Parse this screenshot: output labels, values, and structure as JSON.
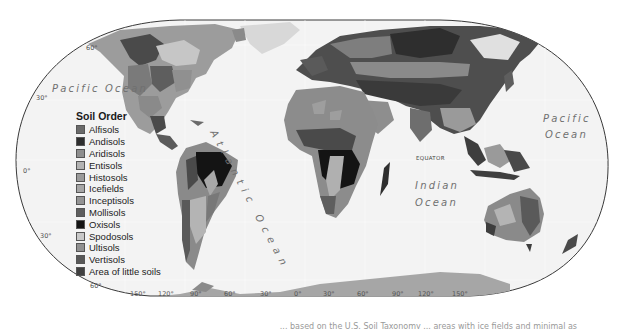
{
  "map": {
    "title": "Soil Order",
    "projection_outline_color": "#3a3a3a",
    "ocean_color": "#f2f2f2",
    "oceans": [
      {
        "label_line1": "Pacific Ocean",
        "position": "west"
      },
      {
        "label_line1": "Pacific",
        "label_line2": "Ocean",
        "position": "east"
      },
      {
        "label": "Atlantic Ocean",
        "position": "center-rotated"
      },
      {
        "label_line1": "Indian",
        "label_line2": "Ocean",
        "position": "south-center"
      }
    ],
    "equator_label": "EQUATOR",
    "latitude_labels": {
      "n60": "60°",
      "n30": "30°",
      "eq": "0°",
      "s30": "30°",
      "s60": "60°"
    },
    "longitude_labels": [
      "150°",
      "120°",
      "90°",
      "60°",
      "30°",
      "0°",
      "30°",
      "60°",
      "90°",
      "120°",
      "150°"
    ]
  },
  "legend": {
    "title": "Soil Order",
    "items": [
      {
        "label": "Alfisols",
        "color": "#6a6a6a"
      },
      {
        "label": "Andisols",
        "color": "#2e2e2e"
      },
      {
        "label": "Aridisols",
        "color": "#8e8e8e"
      },
      {
        "label": "Entisols",
        "color": "#b2b2b2"
      },
      {
        "label": "Histosols",
        "color": "#9a9a9a"
      },
      {
        "label": "Icefields",
        "color": "#a6a6a6"
      },
      {
        "label": "Inceptisols",
        "color": "#949494"
      },
      {
        "label": "Mollisols",
        "color": "#5e5e5e"
      },
      {
        "label": "Oxisols",
        "color": "#141414"
      },
      {
        "label": "Spodosols",
        "color": "#c8c8c8"
      },
      {
        "label": "Ultisols",
        "color": "#909090"
      },
      {
        "label": "Vertisols",
        "color": "#585858"
      },
      {
        "label": "Area of little soils",
        "color": "#404040"
      }
    ]
  },
  "caption": {
    "text_visible_fragment": "... based on the U.S. Soil Taxonomy ... areas with ice fields and minimal as"
  }
}
